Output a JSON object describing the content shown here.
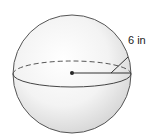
{
  "diagram": {
    "shape": "sphere",
    "radius_label": "6 in",
    "colors": {
      "outline": "#555555",
      "fill_light": "#ffffff",
      "fill_shade": "#d9d9d9",
      "text": "#222222"
    }
  }
}
